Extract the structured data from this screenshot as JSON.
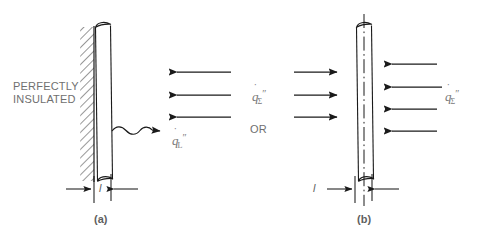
{
  "figure": {
    "type": "engineering-diagram",
    "background_color": "#ffffff",
    "line_color": "#1a1a1a",
    "text_color": "#6d6d6d"
  },
  "panels": [
    {
      "id": "a",
      "caption": "(a)",
      "insulation_label_line1": "PERFECTLY",
      "insulation_label_line2": "INSULATED",
      "dimension_label": "l",
      "incident_arrows": {
        "direction": "left",
        "count": 3
      },
      "emitted_flux": {
        "symbol": "q",
        "dot": "˙",
        "subscript": "L",
        "superscript": "″"
      }
    },
    {
      "id": "b",
      "caption": "(b)",
      "dimension_label": "l",
      "left_arrows": {
        "direction": "right",
        "count": 3
      },
      "right_arrows": {
        "direction": "left",
        "count": 4
      },
      "flux_left": {
        "symbol": "q",
        "dot": "˙",
        "subscript": "Σ",
        "superscript": "″"
      },
      "flux_right": {
        "symbol": "q",
        "dot": "˙",
        "subscript": "Σ",
        "superscript": "″"
      }
    }
  ],
  "connector": {
    "or_label": "OR"
  }
}
